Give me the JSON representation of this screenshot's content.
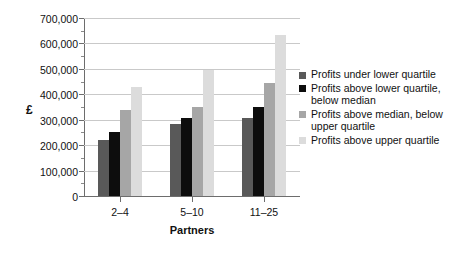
{
  "chart_data": {
    "type": "bar",
    "title": "",
    "subtitle": "",
    "xlabel": "Partners",
    "ylabel": "£",
    "categories": [
      "2–4",
      "5–10",
      "11–25"
    ],
    "series": [
      {
        "name": "Profits under lower quartile",
        "color": "#595959",
        "values": [
          220000,
          285000,
          305000
        ]
      },
      {
        "name": "Profits above lower quartile, below median",
        "color": "#0d0d0d",
        "values": [
          250000,
          305000,
          350000
        ]
      },
      {
        "name": "Profits above median, below upper quartile",
        "color": "#a6a6a6",
        "values": [
          340000,
          350000,
          445000
        ]
      },
      {
        "name": "Profits above upper quartile",
        "color": "#dcdcdc",
        "values": [
          430000,
          495000,
          635000
        ]
      }
    ],
    "ylim": [
      0,
      700000
    ],
    "ytick_values": [
      0,
      100000,
      200000,
      300000,
      400000,
      500000,
      600000,
      700000
    ],
    "ytick_labels": [
      "0",
      "100,000",
      "200,000",
      "300,000",
      "400,000",
      "500,000",
      "600,000",
      "700,000"
    ],
    "yminor_interval": 50000,
    "grid": true,
    "grid_axis": "y",
    "legend_position": "right",
    "legend_entries": [
      "Profits under lower quartile",
      "Profits above lower quartile,\nbelow median",
      "Profits above median, below\nupper quartile",
      "Profits above upper quartile"
    ]
  },
  "colors": {
    "background": "#ffffff",
    "grid": "#c9c9c9",
    "axis": "#6d6d6d",
    "text": "#111111"
  }
}
